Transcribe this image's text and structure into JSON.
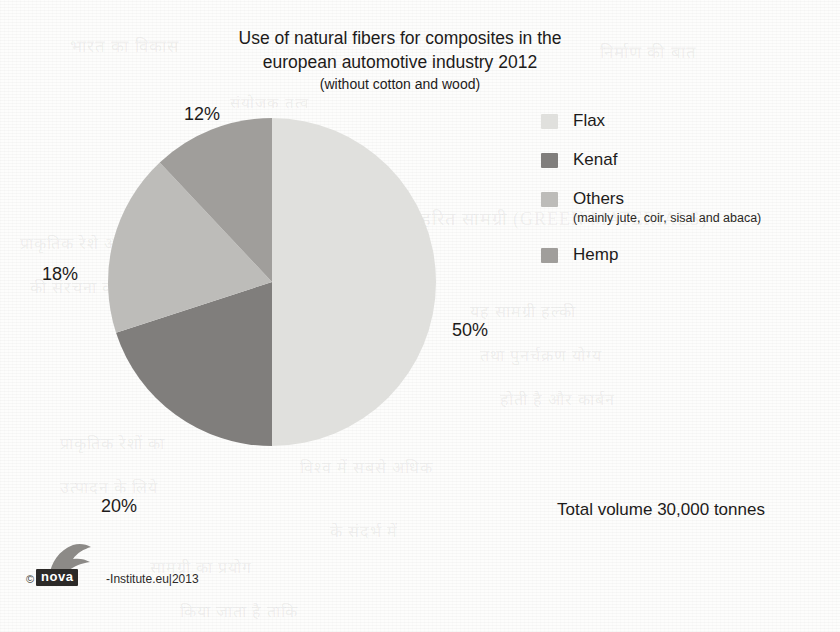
{
  "title": {
    "line1": "Use of natural fibers for composites in the",
    "line2": "european automotive industry 2012",
    "subtitle": "(without cotton and wood)"
  },
  "legend": {
    "items": [
      {
        "label": "Flax",
        "sublabel": "",
        "color": "#e0e0dd"
      },
      {
        "label": "Kenaf",
        "sublabel": "",
        "color": "#807e7c"
      },
      {
        "label": "Others",
        "sublabel": "(mainly jute, coir, sisal and abaca)",
        "color": "#bdbcb9"
      },
      {
        "label": "Hemp",
        "sublabel": "",
        "color": "#a09e9b"
      }
    ]
  },
  "labels": {
    "flax_pct": "50%",
    "kenaf_pct": "20%",
    "others_pct": "18%",
    "hemp_pct": "12%"
  },
  "footer": {
    "total_volume": "Total volume 30,000 tonnes",
    "copyright_mark": "©",
    "logo_wordmark": "nova",
    "credit_text": "-Institute.eu|2013"
  },
  "ghost_lines": [
    {
      "text": "भारत का विकास",
      "x": 70,
      "y": 34,
      "size": 17
    },
    {
      "text": "निर्माण की बात",
      "x": 600,
      "y": 40,
      "size": 17
    },
    {
      "text": "संयोजक तत्व",
      "x": 230,
      "y": 92,
      "size": 15
    },
    {
      "text": "2. हरित सामग्री (GREEN MATERIALS)",
      "x": 400,
      "y": 206,
      "size": 18
    },
    {
      "text": "प्राकृतिक रेशे औद्योगिक",
      "x": 20,
      "y": 232,
      "size": 16
    },
    {
      "text": "की संरचना का उपयोग",
      "x": 30,
      "y": 276,
      "size": 16
    },
    {
      "text": "यह सामग्री हल्की",
      "x": 470,
      "y": 300,
      "size": 16
    },
    {
      "text": "तथा पुनर्चक्रण योग्य",
      "x": 480,
      "y": 344,
      "size": 16
    },
    {
      "text": "होती है और कार्बन",
      "x": 500,
      "y": 388,
      "size": 16
    },
    {
      "text": "प्राकृतिक रेशों का",
      "x": 60,
      "y": 432,
      "size": 16
    },
    {
      "text": "विश्व में सबसे अधिक",
      "x": 300,
      "y": 456,
      "size": 16
    },
    {
      "text": "उत्पादन के लिये",
      "x": 60,
      "y": 476,
      "size": 16
    },
    {
      "text": "के संदर्भ में",
      "x": 330,
      "y": 520,
      "size": 16
    },
    {
      "text": "सामग्री का प्रयोग",
      "x": 150,
      "y": 556,
      "size": 16
    },
    {
      "text": "किया जाता है ताकि",
      "x": 180,
      "y": 600,
      "size": 16
    }
  ],
  "chart_data": {
    "type": "pie",
    "title": "Use of natural fibers for composites in the european automotive industry 2012 (without cotton and wood)",
    "unit": "percent of total volume",
    "total_volume": "30,000 tonnes",
    "legend_position": "right",
    "start_angle_deg": 0,
    "direction": "clockwise",
    "categories": [
      "Flax",
      "Kenaf",
      "Others (mainly jute, coir, sisal and abaca)",
      "Hemp"
    ],
    "values": [
      50,
      20,
      18,
      12
    ],
    "value_labels": [
      "50%",
      "20%",
      "18%",
      "12%"
    ],
    "colors": [
      "#e0e0dd",
      "#807e7c",
      "#bdbcb9",
      "#a09e9b"
    ],
    "absolute_tonnes": [
      15000,
      6000,
      5400,
      3600
    ]
  }
}
